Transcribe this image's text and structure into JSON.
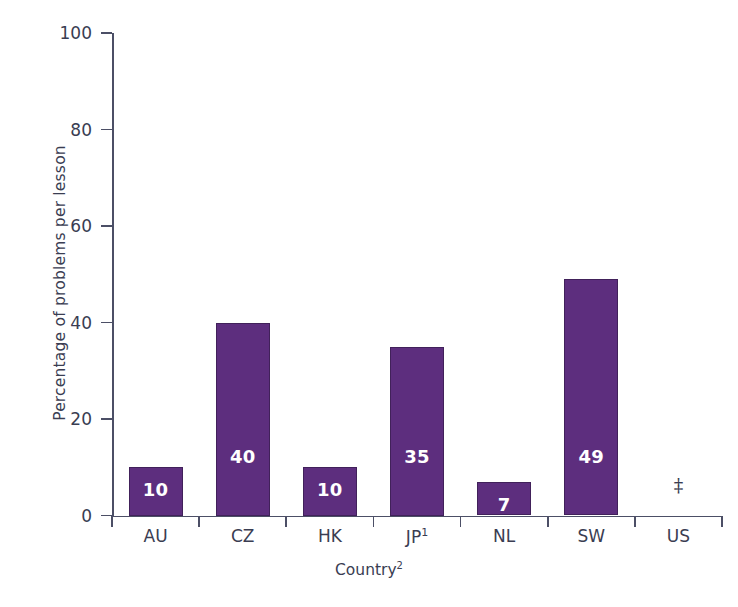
{
  "chart_data": {
    "type": "bar",
    "title": "",
    "subtitle": "",
    "xlabel": "Country",
    "xlabel_superscript": "2",
    "ylabel": "Percentage of problems per lesson",
    "ylim": [
      0,
      100
    ],
    "yticks": [
      0,
      20,
      40,
      60,
      80,
      100
    ],
    "ytick_labels": [
      "0",
      "20",
      "40",
      "60",
      "80",
      "100"
    ],
    "grid": false,
    "legend": "none",
    "bar_color": "#5d2e7e",
    "bar_border_color": "#41215a",
    "axis_color": "#4c4f66",
    "text_color": "#3a3d52",
    "value_label_color": "#ffffff",
    "categories": [
      "AU",
      "CZ",
      "HK",
      "JP",
      "NL",
      "SW",
      "US"
    ],
    "category_labels": [
      "AU",
      "CZ",
      "HK",
      "JP¹",
      "NL",
      "SW",
      "US"
    ],
    "category_superscripts": [
      "",
      "",
      "",
      "1",
      "",
      "",
      ""
    ],
    "values": [
      10,
      40,
      10,
      35,
      7,
      null,
      null
    ],
    "bars": [
      {
        "category": "AU",
        "label": "AU",
        "superscript": "",
        "value": 10,
        "value_label": "10",
        "suppressed": false
      },
      {
        "category": "CZ",
        "label": "CZ",
        "superscript": "",
        "value": 40,
        "value_label": "40",
        "suppressed": false
      },
      {
        "category": "HK",
        "label": "HK",
        "superscript": "",
        "value": 10,
        "value_label": "10",
        "suppressed": false
      },
      {
        "category": "JP",
        "label": "JP",
        "superscript": "1",
        "value": 35,
        "value_label": "35",
        "suppressed": false
      },
      {
        "category": "NL",
        "label": "NL",
        "superscript": "",
        "value": 7,
        "value_label": "7",
        "suppressed": false
      },
      {
        "category": "SW",
        "label": "SW",
        "superscript": "",
        "value": 49,
        "value_label": "49",
        "suppressed": false
      },
      {
        "category": "US",
        "label": "US",
        "superscript": "",
        "value": null,
        "value_label": "‡",
        "suppressed": true
      }
    ],
    "suppressed_symbol": "‡",
    "notes": []
  }
}
